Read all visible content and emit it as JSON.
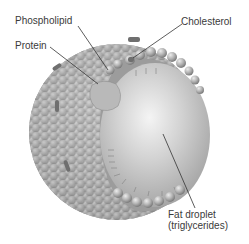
{
  "diagram": {
    "labels": {
      "phospholipid": "Phospholipid",
      "cholesterol": "Cholesterol",
      "protein": "Protein",
      "fat_droplet_line1": "Fat droplet",
      "fat_droplet_line2": "(triglycerides)"
    },
    "colors": {
      "background": "#ffffff",
      "sphere_shell": "#a9a9a9",
      "core": "#c4c4c4",
      "core_highlight": "#f2f2f2",
      "text": "#3a3a3a",
      "leader_line": "#333333"
    }
  }
}
